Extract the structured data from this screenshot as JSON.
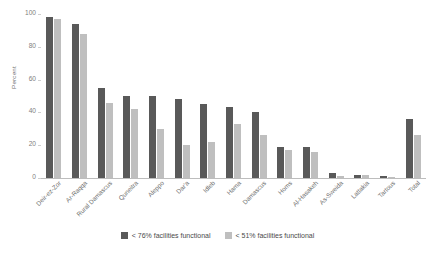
{
  "chart_data": {
    "type": "bar",
    "title": "",
    "subtitle": "",
    "xlabel": "",
    "ylabel": "Percent",
    "ylim": [
      0,
      100
    ],
    "yticks": [
      0,
      20,
      40,
      60,
      80,
      100
    ],
    "grid": false,
    "legend_position": "bottom",
    "categories": [
      "Deir-ez-Zor",
      "Ar-Raqqa",
      "Rural Damascus",
      "Quneitra",
      "Aleppo",
      "Dar'a",
      "Idleb",
      "Hama",
      "Damascus",
      "Homs",
      "Al-Hasakeh",
      "As-Sweida",
      "Lattakia",
      "Tartous",
      "Total"
    ],
    "series": [
      {
        "name": "< 76% facilities functional",
        "color": "#595959",
        "values": [
          98,
          94,
          55,
          50,
          50,
          48,
          45,
          43,
          40,
          19,
          19,
          3,
          2,
          1,
          36
        ]
      },
      {
        "name": "< 51% facilities functional",
        "color": "#bfbfbf",
        "values": [
          97,
          88,
          46,
          42,
          30,
          20,
          22,
          33,
          26,
          17,
          16,
          1,
          2,
          0.5,
          26
        ]
      }
    ]
  },
  "colors": {
    "series_dark": "#595959",
    "series_light": "#bfbfbf",
    "axis": "#bdbdbd",
    "tick_text": "#808080",
    "label_text": "#6f6f6f",
    "legend_text": "#4a4a4a",
    "background": "#ffffff"
  }
}
